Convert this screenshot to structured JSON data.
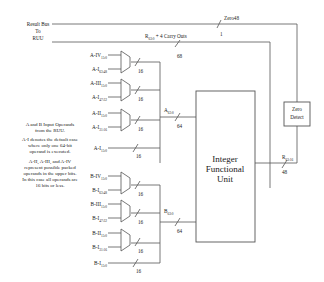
{
  "top": {
    "result_bus_label": [
      "Result Bus",
      "To",
      "RUU"
    ],
    "carry_label": "R",
    "carry_sub": "63:0",
    "carry_suffix": " + 4 Carry Outs",
    "carry_width": "68",
    "zero_label": "Zero48",
    "zero_width": "1"
  },
  "a_inputs": [
    {
      "name": "A-IV",
      "sub": "15:0"
    },
    {
      "name": "A-I",
      "sub": "63:48"
    },
    {
      "name": "A-III",
      "sub": "15:0"
    },
    {
      "name": "A-I",
      "sub": "47:32"
    },
    {
      "name": "A-II",
      "sub": "15:0"
    },
    {
      "name": "A-I",
      "sub": "31:16"
    },
    {
      "name": "A-I",
      "sub": "15:0"
    }
  ],
  "b_inputs": [
    {
      "name": "B-IV",
      "sub": "15:0"
    },
    {
      "name": "B-I",
      "sub": "63:48"
    },
    {
      "name": "B-III",
      "sub": "15:0"
    },
    {
      "name": "B-I",
      "sub": "47:32"
    },
    {
      "name": "B-II",
      "sub": "15:0"
    },
    {
      "name": "B-I",
      "sub": "31:16"
    },
    {
      "name": "B-I",
      "sub": "15:0"
    }
  ],
  "bus_widths": {
    "mux_out": "16",
    "a_bus": "64",
    "b_bus": "64",
    "r_bus": "48"
  },
  "a_bus_label": {
    "name": "A",
    "sub": "63:0"
  },
  "b_bus_label": {
    "name": "B",
    "sub": "63:0"
  },
  "r_bus_label": {
    "name": "R",
    "sub": "63:16"
  },
  "ifu": {
    "lines": [
      "Integer",
      "Functional",
      "Unit"
    ]
  },
  "zero_detect": {
    "lines": [
      "Zero",
      "Detect"
    ]
  },
  "notes": [
    [
      "A and B Input Operands",
      "from the RUU."
    ],
    [
      "A-I denotes the default case",
      "where only one 64-bit",
      "operand is executed."
    ],
    [
      "A-II, A-III, and A-IV",
      "represent possible packed",
      "operands in the upper bits.",
      "In this case all operands are",
      "16 bits or less."
    ]
  ]
}
